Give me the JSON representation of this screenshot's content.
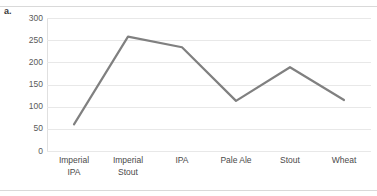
{
  "figure": {
    "label": "a."
  },
  "chart_data": {
    "type": "line",
    "title": "",
    "xlabel": "",
    "ylabel": "",
    "categories": [
      "Imperial IPA",
      "Imperial Stout",
      "IPA",
      "Pale Ale",
      "Stout",
      "Wheat"
    ],
    "category_lines": [
      [
        "Imperial",
        "IPA"
      ],
      [
        "Imperial",
        "Stout"
      ],
      [
        "IPA"
      ],
      [
        "Pale Ale"
      ],
      [
        "Stout"
      ],
      [
        "Wheat"
      ]
    ],
    "values": [
      60,
      258,
      234,
      113,
      189,
      115
    ],
    "ylim": [
      0,
      300
    ],
    "yticks": [
      300,
      250,
      200,
      150,
      100,
      50,
      0
    ],
    "grid": true,
    "legend": false,
    "series_color": "#808080",
    "gridline_color": "#e8e8e8",
    "tick_label_color": "#5a5a5a"
  }
}
